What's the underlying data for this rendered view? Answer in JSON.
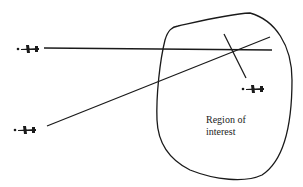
{
  "diagram": {
    "region_label_line1": "Region of",
    "region_label_line2": "interest",
    "colors": {
      "stroke": "#1a1a1a",
      "background": "#ffffff"
    },
    "elements": {
      "aircraft": [
        {
          "id": "aircraft-upper-left",
          "x": 17,
          "y": 48
        },
        {
          "id": "aircraft-lower-left",
          "x": 14,
          "y": 129
        },
        {
          "id": "aircraft-inside-region",
          "x": 245,
          "y": 88
        }
      ],
      "lines": [
        {
          "id": "bearing-line-horizontal",
          "from": [
            44,
            48
          ],
          "to": [
            272,
            50
          ]
        },
        {
          "id": "bearing-line-diagonal",
          "from": [
            47,
            126
          ],
          "to": [
            270,
            37
          ]
        },
        {
          "id": "perpendicular-line",
          "from": [
            224,
            34
          ],
          "to": [
            246,
            78
          ]
        }
      ]
    }
  }
}
